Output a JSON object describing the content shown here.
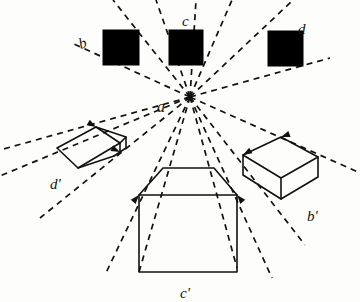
{
  "figure": {
    "background_color": "#fdfdfb",
    "ink_color": "#111111",
    "solid_fill_color": "#000000",
    "vanishing_point": {
      "name": "a",
      "x": 190,
      "y": 97
    },
    "labels": [
      {
        "id": "label-b",
        "text": "b",
        "x": 79,
        "y": 36,
        "rotate": -18,
        "size": 15
      },
      {
        "id": "label-c",
        "text": "c",
        "x": 182,
        "y": 14,
        "rotate": 0,
        "size": 15
      },
      {
        "id": "label-d",
        "text": "d",
        "x": 298,
        "y": 22,
        "rotate": 0,
        "size": 15
      },
      {
        "id": "label-a",
        "text": "a",
        "x": 157,
        "y": 99,
        "rotate": 0,
        "size": 16
      },
      {
        "id": "label-d-prime",
        "text": "d'",
        "x": 50,
        "y": 177,
        "rotate": 0,
        "size": 15
      },
      {
        "id": "label-b-prime",
        "text": "b'",
        "x": 307,
        "y": 209,
        "rotate": 0,
        "size": 15
      },
      {
        "id": "label-c-prime",
        "text": "c'",
        "x": 180,
        "y": 286,
        "rotate": 0,
        "size": 15
      }
    ],
    "squares": [
      {
        "id": "square-b",
        "label": "b",
        "x": 103,
        "y": 30,
        "width": 36,
        "height": 35
      },
      {
        "id": "square-c",
        "label": "c",
        "x": 169,
        "y": 30,
        "width": 34,
        "height": 35
      },
      {
        "id": "square-d",
        "label": "d",
        "x": 268,
        "y": 31,
        "width": 35,
        "height": 35
      }
    ],
    "boxes": [
      {
        "id": "box-d-prime",
        "label": "d'",
        "description": "flat open box lower left",
        "polylines": [
          [
            [
              57,
              148
            ],
            [
              96,
              127
            ],
            [
              120,
              143
            ],
            [
              78,
              168
            ],
            [
              57,
              148
            ]
          ],
          [
            [
              96,
              127
            ],
            [
              126,
              137
            ],
            [
              120,
              143
            ]
          ],
          [
            [
              126,
              137
            ],
            [
              126,
              148
            ],
            [
              114,
              156
            ]
          ],
          [
            [
              78,
              168
            ],
            [
              114,
              156
            ]
          ],
          [
            [
              120,
              143
            ],
            [
              120,
              152
            ]
          ]
        ]
      },
      {
        "id": "box-b-prime",
        "label": "b'",
        "description": "open box lower right",
        "polylines": [
          [
            [
              243,
              155
            ],
            [
              281,
              137
            ],
            [
              318,
              157
            ],
            [
              281,
              178
            ],
            [
              243,
              155
            ]
          ],
          [
            [
              243,
              155
            ],
            [
              243,
              175
            ],
            [
              281,
              199
            ],
            [
              318,
              177
            ],
            [
              318,
              157
            ]
          ],
          [
            [
              281,
              178
            ],
            [
              281,
              199
            ]
          ]
        ]
      },
      {
        "id": "box-c-prime",
        "label": "c'",
        "description": "frontal box with trapezoid top, bottom center",
        "polylines": [
          [
            [
              139,
              195
            ],
            [
              163,
              168
            ],
            [
              214,
              168
            ],
            [
              237,
              195
            ],
            [
              139,
              195
            ]
          ],
          [
            [
              139,
              195
            ],
            [
              139,
              272
            ],
            [
              237,
              272
            ],
            [
              237,
              195
            ]
          ]
        ]
      }
    ],
    "rays": [
      {
        "id": "ray-1",
        "from": [
          190,
          97
        ],
        "to": [
          113,
          0
        ]
      },
      {
        "id": "ray-2",
        "from": [
          190,
          97
        ],
        "to": [
          156,
          0
        ]
      },
      {
        "id": "ray-3",
        "from": [
          190,
          97
        ],
        "to": [
          196,
          0
        ]
      },
      {
        "id": "ray-4",
        "from": [
          190,
          97
        ],
        "to": [
          232,
          0
        ]
      },
      {
        "id": "ray-5",
        "from": [
          190,
          97
        ],
        "to": [
          291,
          2
        ]
      },
      {
        "id": "ray-6",
        "from": [
          190,
          97
        ],
        "to": [
          74,
          44
        ]
      },
      {
        "id": "ray-7",
        "from": [
          190,
          97
        ],
        "to": [
          330,
          58
        ]
      },
      {
        "id": "ray-8",
        "from": [
          190,
          97
        ],
        "to": [
          0,
          150
        ]
      },
      {
        "id": "ray-9",
        "from": [
          190,
          97
        ],
        "to": [
          0,
          176
        ]
      },
      {
        "id": "ray-10",
        "from": [
          190,
          97
        ],
        "to": [
          360,
          173
        ]
      },
      {
        "id": "ray-11",
        "from": [
          190,
          97
        ],
        "to": [
          40,
          218
        ]
      },
      {
        "id": "ray-12",
        "from": [
          190,
          97
        ],
        "to": [
          105,
          275
        ]
      },
      {
        "id": "ray-13",
        "from": [
          190,
          97
        ],
        "to": [
          139,
          272
        ]
      },
      {
        "id": "ray-14",
        "from": [
          190,
          97
        ],
        "to": [
          237,
          268
        ]
      },
      {
        "id": "ray-15",
        "from": [
          190,
          97
        ],
        "to": [
          272,
          278
        ]
      },
      {
        "id": "ray-16",
        "from": [
          190,
          97
        ],
        "to": [
          305,
          245
        ]
      }
    ],
    "arrow_heads": [
      {
        "id": "arrow-d-prime-top",
        "x": 96,
        "y": 127,
        "angle": 210
      },
      {
        "id": "arrow-d-prime-right",
        "x": 120,
        "y": 152,
        "angle": 205
      },
      {
        "id": "arrow-b-prime-top",
        "x": 281,
        "y": 137,
        "angle": 340
      },
      {
        "id": "arrow-b-prime-left",
        "x": 243,
        "y": 155,
        "angle": 330
      },
      {
        "id": "arrow-c-prime-left",
        "x": 139,
        "y": 195,
        "angle": 130
      },
      {
        "id": "arrow-c-prime-right",
        "x": 237,
        "y": 195,
        "angle": 50
      }
    ]
  }
}
